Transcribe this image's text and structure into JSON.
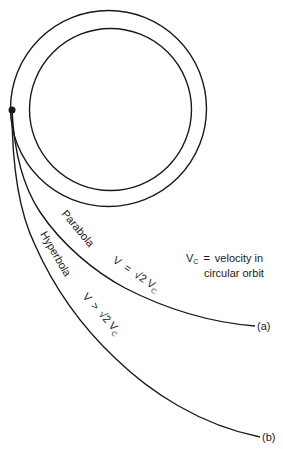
{
  "diagram": {
    "colors": {
      "stroke": "#1a1a1a",
      "background": "#ffffff"
    },
    "planet": {
      "outer_radius": 98,
      "inner_radius": 81,
      "center": [
        108,
        108
      ]
    },
    "launch_point": [
      12,
      110
    ],
    "curves": {
      "parabola": {
        "name": "Parabola",
        "condition_prefix": "V",
        "condition_op": "=",
        "condition_root": "√2",
        "condition_v": "V",
        "condition_sub": "C",
        "end_label": "(a)"
      },
      "hyperbola": {
        "name": "Hyperbola",
        "condition_prefix": "V",
        "condition_op": ">",
        "condition_root": "√2",
        "condition_v": "V",
        "condition_sub": "C",
        "end_label": "(b)"
      }
    },
    "legend": {
      "symbol": "V",
      "symbol_sub": "C",
      "equals": "=",
      "line1": "velocity in",
      "line2": "circular orbit"
    }
  }
}
